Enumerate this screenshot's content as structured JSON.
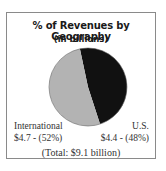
{
  "chart_data": {
    "type": "pie",
    "title": "% of Revenues by Geography",
    "subtitle": "(in billions)",
    "categories": [
      "U.S.",
      "International"
    ],
    "values": [
      4.4,
      4.7
    ],
    "percentages": [
      48,
      52
    ],
    "units": "billions USD",
    "colors": [
      "#111111",
      "#b3b3b3"
    ],
    "labels": [
      {
        "name": "U.S.",
        "value_text": "$4.4 - (48%)"
      },
      {
        "name": "International",
        "value_text": "$4.7 - (52%)"
      }
    ],
    "annotation": "(Total: $9.1 billion)",
    "legend": "none"
  },
  "labels": {
    "intl_name": "International",
    "intl_value": "$4.7 - (52%)",
    "us_name": "U.S.",
    "us_value": "$4.4 - (48%)"
  }
}
